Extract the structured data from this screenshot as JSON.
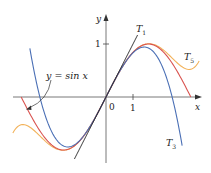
{
  "chart_data": {
    "type": "line",
    "title": "",
    "xlabel": "x",
    "ylabel": "y",
    "xlim": [
      -3.45,
      3.55
    ],
    "ylim": [
      -1.22,
      1.55
    ],
    "grid": false,
    "x_ticks": [
      {
        "value": 1,
        "label": "1"
      }
    ],
    "y_ticks": [
      {
        "value": 1,
        "label": "1"
      }
    ],
    "origin_label": "0",
    "series": [
      {
        "name": "T_5",
        "label": "T",
        "sub": "5",
        "formula": "x - x^3/6 + x^5/120",
        "color": "#f2b25a",
        "domain": [
          -3.45,
          3.45
        ]
      },
      {
        "name": "sin x",
        "label": "y = sin x",
        "formula": "sin(x)",
        "color": "#d9534f",
        "domain": [
          -3.14,
          3.14
        ]
      },
      {
        "name": "T_3",
        "label": "T",
        "sub": "3",
        "formula": "x - x^3/6",
        "color": "#4a6fb5",
        "domain": [
          -2.82,
          2.82
        ]
      },
      {
        "name": "T_1",
        "label": "T",
        "sub": "1",
        "formula": "x",
        "color": "#222222",
        "domain": [
          -1.17,
          1.17
        ]
      }
    ],
    "annotations": [
      {
        "text": "y = sin x",
        "points_to": "sin x curve near x = -3.0"
      },
      {
        "text": "T1",
        "near": "upper end of tangent line"
      },
      {
        "text": "T5",
        "near": "right end of quintic curve"
      },
      {
        "text": "T3",
        "near": "lower right end of cubic curve"
      }
    ]
  },
  "labels": {
    "x_axis": "x",
    "y_axis": "y",
    "origin": "0",
    "x_tick_1": "1",
    "y_tick_1": "1",
    "sin_label": "y = sin x",
    "T": "T",
    "sub_1": "1",
    "sub_3": "3",
    "sub_5": "5"
  }
}
